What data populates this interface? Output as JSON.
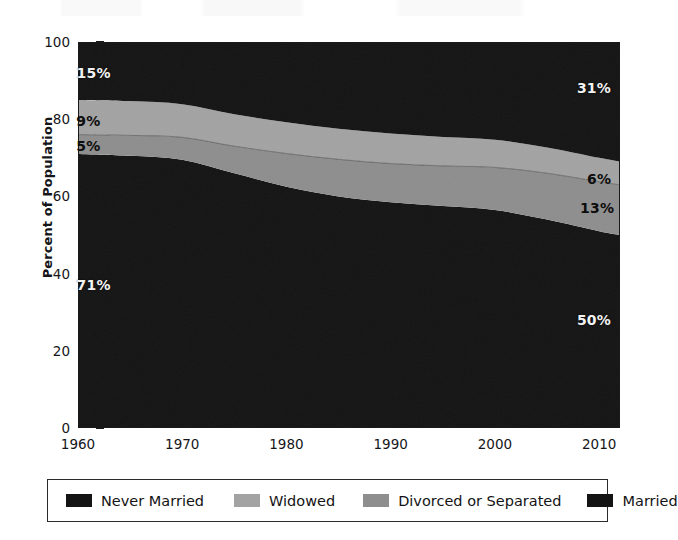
{
  "chart_data": {
    "type": "area",
    "stacked": true,
    "title": "",
    "subtitle": "",
    "xlabel": "",
    "ylabel": "Percent of Population",
    "xlim": [
      1960,
      2012
    ],
    "ylim": [
      0,
      100
    ],
    "grid": false,
    "legend_position": "bottom",
    "x_ticks": [
      "1960",
      "1970",
      "1980",
      "1990",
      "2000",
      "2010"
    ],
    "x_tick_values": [
      1960,
      1970,
      1980,
      1990,
      2000,
      2010
    ],
    "y_ticks": [
      "0",
      "20",
      "40",
      "60",
      "80",
      "100"
    ],
    "y_tick_values": [
      0,
      20,
      40,
      60,
      80,
      100
    ],
    "x": [
      1960,
      1965,
      1970,
      1975,
      1980,
      1985,
      1990,
      1995,
      2000,
      2005,
      2010,
      2012
    ],
    "series": [
      {
        "name": "Married",
        "color": "#141414",
        "stack_order": 1,
        "values": [
          71,
          70.5,
          69.5,
          66,
          62.5,
          60,
          58.5,
          57.5,
          56.5,
          54,
          51,
          50
        ],
        "start_label": "71%",
        "end_label": "50%"
      },
      {
        "name": "Divorced or Separated",
        "color": "#8e8e8e",
        "stack_order": 2,
        "values": [
          5,
          5.3,
          5.8,
          7,
          8.6,
          9.6,
          10,
          10.4,
          11,
          12,
          12.8,
          13
        ],
        "start_label": "5%",
        "end_label": "13%"
      },
      {
        "name": "Widowed",
        "color": "#a3a3a3",
        "stack_order": 3,
        "values": [
          9,
          8.9,
          8.6,
          8.3,
          8.1,
          7.9,
          7.8,
          7.5,
          7.2,
          6.7,
          6.2,
          6
        ],
        "start_label": "9%",
        "end_label": "6%"
      },
      {
        "name": "Never Married",
        "color": "#141414",
        "stack_order": 4,
        "values": [
          15,
          15.3,
          16.1,
          18.7,
          20.8,
          22.5,
          23.7,
          24.6,
          25.3,
          27.3,
          30,
          31
        ],
        "start_label": "15%",
        "end_label": "31%"
      }
    ],
    "annotations": [
      {
        "text": "15%",
        "series": "Never Married",
        "side": "left",
        "x": 1961.5,
        "y": 92
      },
      {
        "text": "9%",
        "series": "Widowed",
        "side": "left",
        "x": 1961.0,
        "y": 79.5
      },
      {
        "text": "5%",
        "series": "Divorced or Separated",
        "side": "left",
        "x": 1961.0,
        "y": 73
      },
      {
        "text": "71%",
        "series": "Married",
        "side": "left",
        "x": 1961.5,
        "y": 37
      },
      {
        "text": "31%",
        "series": "Never Married",
        "side": "right",
        "x": 2009.5,
        "y": 88
      },
      {
        "text": "6%",
        "series": "Widowed",
        "side": "right",
        "x": 2010.0,
        "y": 64.5
      },
      {
        "text": "13%",
        "series": "Divorced or Separated",
        "side": "right",
        "x": 2009.8,
        "y": 57
      },
      {
        "text": "50%",
        "series": "Married",
        "side": "right",
        "x": 2009.5,
        "y": 28
      }
    ]
  },
  "legend": {
    "items": [
      {
        "label": "Never Married",
        "color": "#141414"
      },
      {
        "label": "Widowed",
        "color": "#a3a3a3"
      },
      {
        "label": "Divorced or Separated",
        "color": "#8e8e8e"
      },
      {
        "label": "Married",
        "color": "#141414"
      }
    ]
  },
  "colors": {
    "axis": "#1a1a1a",
    "text": "#15161a",
    "background": "#ffffff",
    "label_light": "#f2f2f2",
    "label_dark": "#0d0d0d"
  }
}
